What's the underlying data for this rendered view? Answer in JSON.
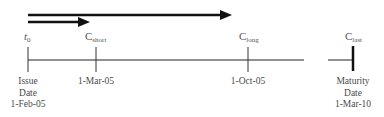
{
  "diagram": {
    "type": "timeline",
    "arrows": [
      {
        "name": "long-period-arrow",
        "from": "t0",
        "to": "C_long"
      },
      {
        "name": "short-period-arrow",
        "from": "t0",
        "to": "C_short"
      }
    ],
    "points": [
      {
        "symbol": "t",
        "sub": "0",
        "label_lines": [
          "Issue",
          "Date",
          "1-Feb-05"
        ]
      },
      {
        "symbol": "C",
        "sub": "short",
        "label_lines": [
          "1-Mar-05"
        ]
      },
      {
        "symbol": "C",
        "sub": "long",
        "label_lines": [
          "1-Oct-05"
        ]
      },
      {
        "symbol": "C",
        "sub": "last",
        "label_lines": [
          "Maturity",
          "Date",
          "1-Mar-10"
        ]
      }
    ],
    "colors": {
      "line": "#222222",
      "text": "#4a4a4a"
    }
  }
}
